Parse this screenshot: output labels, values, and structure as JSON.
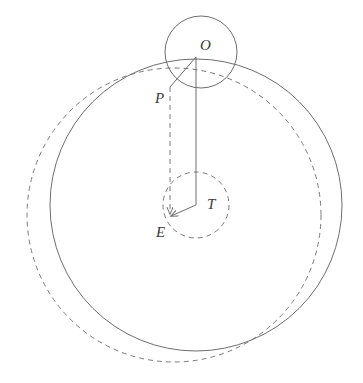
{
  "figure": {
    "type": "geometric-diagram",
    "canvas": {
      "width": 363,
      "height": 383,
      "background": "#ffffff"
    },
    "style": {
      "stroke_color": "#6e6e6e",
      "label_color": "#3a3a3a",
      "stroke_width": 1,
      "dash_pattern": "5 4"
    },
    "points": [
      {
        "id": "O",
        "label": "O",
        "x": 196,
        "y": 57,
        "label_x": 200,
        "label_y": 38
      },
      {
        "id": "P",
        "label": "P",
        "x": 170,
        "y": 87,
        "label_x": 155,
        "label_y": 91
      },
      {
        "id": "T",
        "label": "T",
        "x": 196,
        "y": 205,
        "label_x": 207,
        "label_y": 197
      },
      {
        "id": "E",
        "label": "E",
        "x": 170,
        "y": 218,
        "label_x": 156,
        "label_y": 225
      }
    ],
    "circles": [
      {
        "id": "small-circle-O",
        "name": "small circle about O",
        "cx": 201,
        "cy": 52,
        "r": 36,
        "style": "solid"
      },
      {
        "id": "large-solid-circle",
        "name": "large solid circle",
        "cx": 196,
        "cy": 205,
        "r": 146,
        "style": "solid"
      },
      {
        "id": "large-dashed-circle",
        "name": "large dashed circle",
        "cx": 174,
        "cy": 215,
        "r": 147,
        "style": "dashed"
      },
      {
        "id": "small-circle-T",
        "name": "small dashed circle about T",
        "cx": 196,
        "cy": 205,
        "r": 33,
        "style": "dashed"
      }
    ],
    "segments": [
      {
        "id": "O-P",
        "name": "segment O to P",
        "from": "O",
        "to": "P",
        "style": "solid",
        "arrow": false
      },
      {
        "id": "O-T",
        "name": "segment O to T",
        "from": "O",
        "to": "T",
        "style": "solid",
        "arrow": false
      },
      {
        "id": "T-E",
        "name": "arrow T to E",
        "from": "T",
        "to": "E",
        "style": "solid",
        "arrow": true
      },
      {
        "id": "P-E",
        "name": "dashed arrow P to E",
        "from": "P",
        "to": "E",
        "style": "dashed",
        "arrow": true
      }
    ]
  }
}
